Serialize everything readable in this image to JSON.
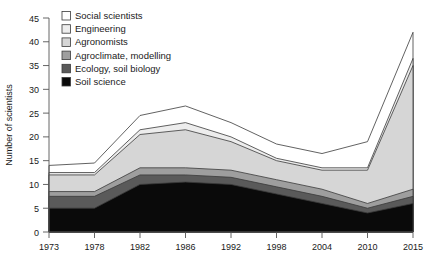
{
  "chart_data": {
    "type": "area",
    "title": "",
    "subtitle": "",
    "xlabel": "",
    "ylabel": "Number of scientists",
    "stacked": true,
    "grid": false,
    "legend_position": "top-left",
    "categories": [
      "1973",
      "1978",
      "1982",
      "1986",
      "1992",
      "1998",
      "2004",
      "2010",
      "2015"
    ],
    "x_tick_labels": [
      "1973",
      "1978",
      "1982",
      "1986",
      "1992",
      "1998",
      "2004",
      "2010",
      "2015"
    ],
    "y_tick_labels": [
      "0",
      "5",
      "10",
      "15",
      "20",
      "25",
      "30",
      "35",
      "40",
      "45"
    ],
    "ylim": [
      0,
      45
    ],
    "ytick_step": 5,
    "series": [
      {
        "name": "Soil science",
        "color": "#0a0a0a",
        "values": [
          5,
          5,
          10,
          10.5,
          10,
          8,
          6,
          4,
          6
        ]
      },
      {
        "name": "Ecology, soil biology",
        "color": "#5a5a5a",
        "values": [
          2.5,
          2.5,
          2,
          1.5,
          1.5,
          1.5,
          1.5,
          1,
          1.5
        ]
      },
      {
        "name": "Agroclimate, modelling",
        "color": "#9e9e9e",
        "values": [
          1,
          1,
          1.5,
          1.5,
          1.5,
          1.5,
          1.5,
          1,
          1.5
        ]
      },
      {
        "name": "Agronomists",
        "color": "#d6d6d6",
        "values": [
          3.5,
          3.5,
          7,
          8,
          6,
          4,
          4,
          7,
          26
        ]
      },
      {
        "name": "Engineering",
        "color": "#ededed",
        "values": [
          0.5,
          0.5,
          1,
          1.5,
          1,
          0.5,
          0.5,
          0.5,
          1.5
        ]
      },
      {
        "name": "Social scientists",
        "color": "#ffffff",
        "values": [
          1.5,
          2,
          3,
          3.5,
          3,
          3,
          3,
          5.5,
          5.5
        ]
      }
    ],
    "totals": [
      14,
      14.5,
      24.5,
      26.5,
      23,
      18.5,
      16.5,
      19,
      42
    ],
    "legend_order": [
      "Social scientists",
      "Engineering",
      "Agronomists",
      "Agroclimate, modelling",
      "Ecology, soil biology",
      "Soil science"
    ]
  },
  "colors": {
    "axis": "#555555",
    "outline": "#3a3a3a",
    "text": "#1a1a1a",
    "background": "#ffffff"
  }
}
